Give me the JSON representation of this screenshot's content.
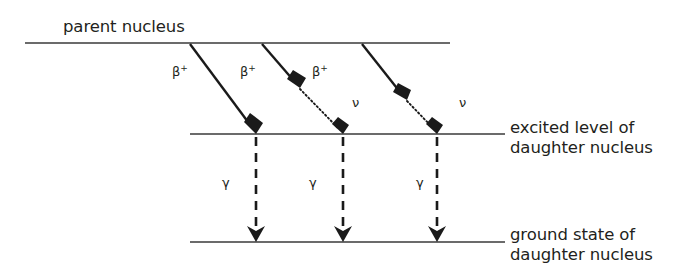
{
  "diagram": {
    "background_color": "#ffffff",
    "line_color": "#3a3a3a",
    "arrow_color": "#1a1a1a",
    "text_color": "#231f20",
    "levels": [
      {
        "id": "parent",
        "label_line1": "parent nucleus",
        "label_line2": "",
        "label_position": "above-left",
        "y": 43,
        "x_start": 25,
        "x_end": 450
      },
      {
        "id": "excited",
        "label_line1": "excited level of",
        "label_line2": "daughter nucleus",
        "label_position": "right",
        "y": 134,
        "x_start": 190,
        "x_end": 505
      },
      {
        "id": "ground",
        "label_line1": "ground state of",
        "label_line2": "daughter nucleus",
        "label_position": "right",
        "y": 242,
        "x_start": 190,
        "x_end": 505
      }
    ],
    "transitions": [
      {
        "id": "beta-1",
        "kind": "beta-plus",
        "label": "β",
        "superscript": "+",
        "label_x": 178,
        "label_y": 76,
        "solid": {
          "x1": 190,
          "y1": 44,
          "x2": 256,
          "y2": 133
        },
        "dotted": null
      },
      {
        "id": "beta-2",
        "kind": "beta-plus",
        "label": "β",
        "superscript": "+",
        "label_x": 246,
        "label_y": 76,
        "solid": {
          "x1": 262,
          "y1": 44,
          "x2": 299,
          "y2": 87
        },
        "dotted": {
          "x1": 299,
          "y1": 87,
          "x2": 343,
          "y2": 133
        }
      },
      {
        "id": "beta-3",
        "kind": "beta-plus",
        "label": "β",
        "superscript": "+",
        "label_x": 318,
        "label_y": 76,
        "solid": {
          "x1": 362,
          "y1": 44,
          "x2": 406,
          "y2": 99
        },
        "dotted": {
          "x1": 406,
          "y1": 99,
          "x2": 437,
          "y2": 133
        }
      }
    ],
    "neutrino_labels": [
      {
        "id": "nu-1",
        "label": "ν",
        "x": 356,
        "y": 107
      },
      {
        "id": "nu-2",
        "label": "ν",
        "x": 463,
        "y": 107
      }
    ],
    "gamma_transitions": [
      {
        "id": "gamma-1",
        "label": "γ",
        "label_x": 226,
        "label_y": 187,
        "x": 256,
        "y1": 136,
        "y2": 241
      },
      {
        "id": "gamma-2",
        "label": "γ",
        "label_x": 313,
        "label_y": 187,
        "x": 343,
        "y1": 136,
        "y2": 241
      },
      {
        "id": "gamma-3",
        "label": "γ",
        "label_x": 420,
        "label_y": 187,
        "x": 437,
        "y1": 136,
        "y2": 241
      }
    ],
    "text_labels": [
      {
        "id": "parent-nucleus-label",
        "text": "parent nucleus",
        "x": 63,
        "y": 32
      },
      {
        "id": "excited-level-label-1",
        "text": "excited level of",
        "x": 510,
        "y": 133
      },
      {
        "id": "excited-level-label-2",
        "text": "daughter nucleus",
        "x": 510,
        "y": 153
      },
      {
        "id": "ground-state-label-1",
        "text": "ground state of",
        "x": 510,
        "y": 240
      },
      {
        "id": "ground-state-label-2",
        "text": "daughter nucleus",
        "x": 510,
        "y": 260
      }
    ]
  }
}
